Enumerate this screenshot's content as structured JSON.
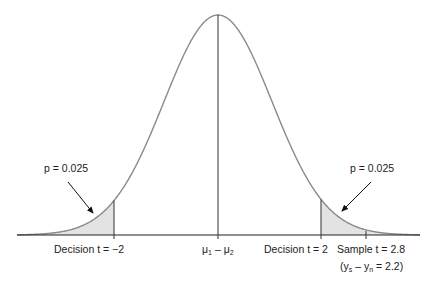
{
  "diagram": {
    "type": "normal-distribution-two-tailed-test",
    "curve": {
      "center_x": 218,
      "peak_y": 15,
      "baseline_y": 235,
      "sigma_px": 54,
      "x_start": 17,
      "x_end": 420,
      "stroke": "#8a8a8a"
    },
    "shade_fill": "#e3e3e3",
    "axis_color": "#222222",
    "labels": {
      "left_p": "p = 0.025",
      "right_p": "p = 0.025",
      "left_decision": "Decision t = −2",
      "center_prefix": "μ",
      "center_sub1": "1",
      "center_minus": " – μ",
      "center_sub2": "2",
      "right_decision": "Decision t = 2",
      "sample": "Sample t = 2.8",
      "sample_diff_open": "(y",
      "sample_diff_sub1": "s",
      "sample_diff_mid": " – y",
      "sample_diff_sub2": "n",
      "sample_diff_close": " = 2.2)"
    },
    "markers": {
      "left_decision_x": 114,
      "center_x": 218,
      "right_decision_x": 321,
      "sample_x": 366
    }
  }
}
